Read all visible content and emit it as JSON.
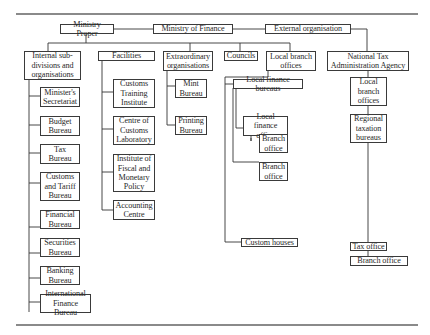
{
  "diagram": {
    "type": "organisation-chart",
    "top_level": {
      "ministry_proper": "Ministry Proper",
      "ministry_of_finance": "Ministry of Finance",
      "external_organisation": "External organisation"
    },
    "ministry_proper_groups": {
      "internal": {
        "label": "Internal sub-\ndivisions and\norganisations",
        "children": [
          "Minister's\nSecretariat",
          "Budget\nBureau",
          "Tax\nBureau",
          "Customs\nand Tariff\nBureau",
          "Financial\nBureau",
          "Securities\nBureau",
          "Banking\nBureau",
          "International\nFinance Bureau"
        ]
      },
      "facilities": {
        "label": "Facilities",
        "children": [
          "Customs\nTraining\nInstitute",
          "Centre of\nCustoms\nLaboratory",
          "Institute of\nFiscal and\nMonetary\nPolicy",
          "Accounting\nCentre"
        ]
      },
      "extraordinary": {
        "label": "Extraordinary\norganisations",
        "children": [
          "Mint\nBureau",
          "Printing\nBureau"
        ]
      },
      "councils": {
        "label": "Councils"
      },
      "local_branch_offices": {
        "label": "Local branch\noffices",
        "local_finance_bureaus": "Local finance bureaus",
        "local_finance_office": "Local finance\noffice",
        "branch_office_under_office": "Branch\noffice",
        "branch_office_under_bureau": "Branch\noffice",
        "custom_houses": "Custom houses"
      }
    },
    "external": {
      "agency": "National Tax\nAdministration Agency",
      "local_branch_offices": "Local\nbranch\noffices",
      "regional_taxation_bureaus": "Regional\ntaxation\nbureaus",
      "tax_office": "Tax office",
      "branch_office": "Branch office"
    }
  }
}
